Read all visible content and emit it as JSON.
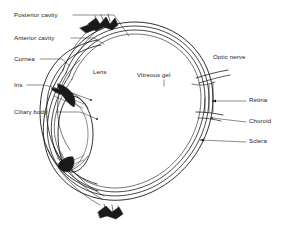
{
  "figure": {
    "kind": "anatomical-cross-section",
    "background_color": "#ffffff",
    "stroke_color": "#1a1a1a",
    "fill_color": "#ffffff"
  },
  "labels": {
    "posterior_cavity": "Posterior cavity",
    "anterior_cavity": "Anterior cavity",
    "cornea": "Cornea",
    "iris": "Iris",
    "ciliary_body": "Ciliary body",
    "lens": "Lens",
    "vitreous_gel": "Vitreous gel",
    "optic_nerve": "Optic nerve",
    "retina": "Retina",
    "choroid": "Choroid",
    "sclera": "Sclera"
  },
  "label_positions": {
    "posterior_cavity": {
      "x": 14,
      "y": 15,
      "align": "left"
    },
    "anterior_cavity": {
      "x": 14,
      "y": 38,
      "align": "left"
    },
    "cornea": {
      "x": 14,
      "y": 59,
      "align": "left"
    },
    "iris": {
      "x": 14,
      "y": 85,
      "align": "left"
    },
    "ciliary_body": {
      "x": 14,
      "y": 112,
      "align": "left"
    },
    "lens": {
      "x": 93,
      "y": 76,
      "align": "left"
    },
    "vitreous_gel": {
      "x": 137,
      "y": 76,
      "align": "left"
    },
    "optic_nerve": {
      "x": 214,
      "y": 58,
      "align": "left"
    },
    "retina": {
      "x": 249,
      "y": 98,
      "align": "left"
    },
    "choroid": {
      "x": 249,
      "y": 120,
      "align": "left"
    },
    "sclera": {
      "x": 249,
      "y": 139,
      "align": "left"
    }
  }
}
